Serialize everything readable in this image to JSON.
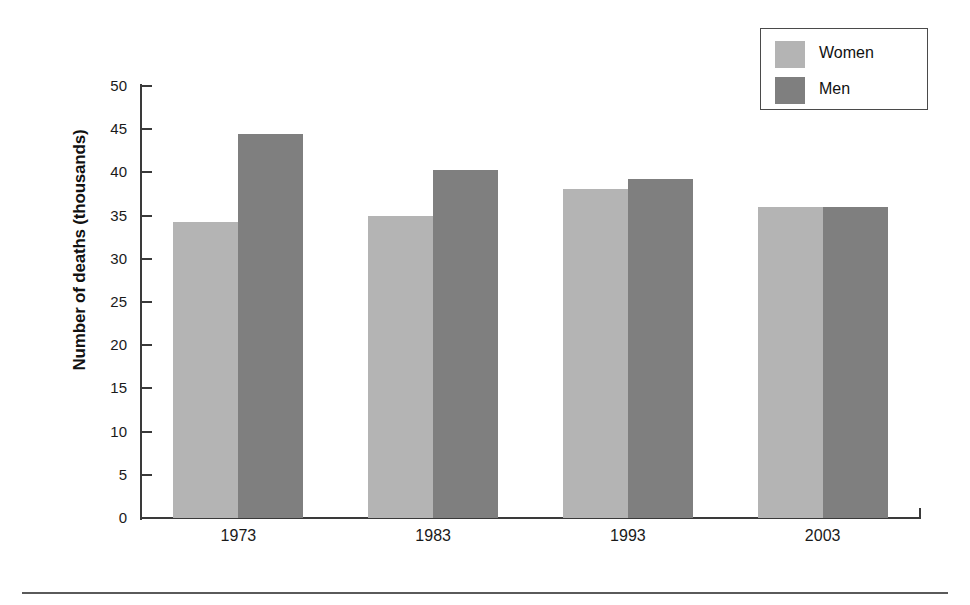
{
  "chart_data": {
    "type": "bar",
    "title": "",
    "xlabel": "",
    "ylabel": "Number of deaths (thousands)",
    "categories": [
      "1973",
      "1983",
      "1993",
      "2003"
    ],
    "series": [
      {
        "name": "Women",
        "color": "#b4b4b4",
        "values": [
          34.3,
          35.0,
          38.1,
          36.0
        ]
      },
      {
        "name": "Men",
        "color": "#7f7f7f",
        "values": [
          44.5,
          40.3,
          39.2,
          36.0
        ]
      }
    ],
    "ylim": [
      0,
      50
    ],
    "ytick_step": 5,
    "yticks": [
      0,
      5,
      10,
      15,
      20,
      25,
      30,
      35,
      40,
      45,
      50
    ],
    "ytick_labels": [
      "0",
      "5",
      "10",
      "15",
      "20",
      "25",
      "30",
      "35",
      "40",
      "45",
      "50"
    ],
    "grid": false,
    "legend_position": "top-right",
    "legend_entries": [
      "Women",
      "Men"
    ]
  },
  "axes": {
    "y_title": "Number of deaths (thousands)"
  },
  "legend": {
    "items": [
      {
        "label": "Women",
        "color": "#b4b4b4"
      },
      {
        "label": "Men",
        "color": "#7f7f7f"
      }
    ]
  }
}
